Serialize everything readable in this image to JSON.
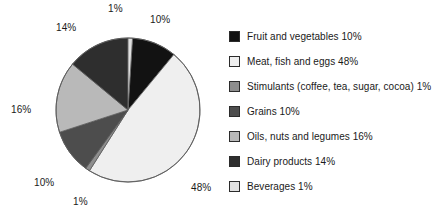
{
  "chart_data": {
    "type": "pie",
    "title": "",
    "subtitle": "",
    "xlabel": "",
    "ylabel": "",
    "grid": false,
    "legend_position": "right",
    "unit": "%",
    "total": 100,
    "categories": [
      "Fruit and vegetables",
      "Meat, fish and eggs",
      "Stimulants (coffee, tea, sugar, cocoa)",
      "Grains",
      "Oils, nuts and legumes",
      "Dairy products",
      "Beverages"
    ],
    "values": [
      10,
      48,
      1,
      10,
      16,
      14,
      1
    ],
    "colors": [
      "#121212",
      "#efefef",
      "#8e8e8e",
      "#4d4d4d",
      "#b9b9b9",
      "#2e2e2e",
      "#e0e0e0"
    ],
    "slices": [
      {
        "label": "Fruit and vegetables",
        "value": 10,
        "display": "10%",
        "color": "#121212",
        "start_angle": 3.6,
        "end_angle": 39.6
      },
      {
        "label": "Meat, fish and eggs",
        "value": 48,
        "display": "48%",
        "color": "#efefef",
        "start_angle": 39.6,
        "end_angle": 212.4
      },
      {
        "label": "Stimulants (coffee, tea, sugar, cocoa)",
        "value": 1,
        "display": "1%",
        "color": "#8e8e8e",
        "start_angle": 212.4,
        "end_angle": 216.0
      },
      {
        "label": "Grains",
        "value": 10,
        "display": "10%",
        "color": "#4d4d4d",
        "start_angle": 216.0,
        "end_angle": 252.0
      },
      {
        "label": "Oils, nuts and legumes",
        "value": 16,
        "display": "16%",
        "color": "#b9b9b9",
        "start_angle": 252.0,
        "end_angle": 309.6
      },
      {
        "label": "Dairy products",
        "value": 14,
        "display": "14%",
        "color": "#2e2e2e",
        "start_angle": 309.6,
        "end_angle": 360.0
      },
      {
        "label": "Beverages",
        "value": 1,
        "display": "1%",
        "color": "#e0e0e0",
        "start_angle": 0.0,
        "end_angle": 3.6
      }
    ],
    "value_labels": [
      {
        "text": "1%",
        "name": "pie-value-label-beverages",
        "x": 108,
        "y": 3
      },
      {
        "text": "10%",
        "name": "pie-value-label-fruit",
        "x": 150,
        "y": 14
      },
      {
        "text": "48%",
        "name": "pie-value-label-meat",
        "x": 191,
        "y": 182
      },
      {
        "text": "1%",
        "name": "pie-value-label-stimulants",
        "x": 73,
        "y": 196
      },
      {
        "text": "10%",
        "name": "pie-value-label-grains",
        "x": 34,
        "y": 177
      },
      {
        "text": "16%",
        "name": "pie-value-label-oils",
        "x": 11,
        "y": 104
      },
      {
        "text": "14%",
        "name": "pie-value-label-dairy",
        "x": 56,
        "y": 22
      }
    ]
  },
  "legend": {
    "items": [
      {
        "label": "Fruit and vegetables 10%",
        "name": "legend-item-fruit-and-vegetables",
        "color": "#121212"
      },
      {
        "label": "Meat, fish and eggs 48%",
        "name": "legend-item-meat-fish-and-eggs",
        "color": "#efefef"
      },
      {
        "label": "Stimulants (coffee, tea, sugar, cocoa) 1%",
        "name": "legend-item-stimulants",
        "color": "#8e8e8e"
      },
      {
        "label": "Grains 10%",
        "name": "legend-item-grains",
        "color": "#4d4d4d"
      },
      {
        "label": "Oils, nuts and legumes 16%",
        "name": "legend-item-oils-nuts-and-legumes",
        "color": "#b9b9b9"
      },
      {
        "label": "Dairy products 14%",
        "name": "legend-item-dairy-products",
        "color": "#2e2e2e"
      },
      {
        "label": "Beverages 1%",
        "name": "legend-item-beverages",
        "color": "#e0e0e0"
      }
    ]
  },
  "geometry": {
    "center_x": 128,
    "center_y": 110,
    "radius": 72,
    "outline_color": "#5a5a5a"
  }
}
